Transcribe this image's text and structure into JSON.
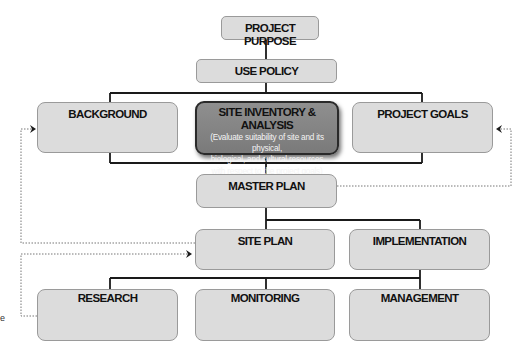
{
  "diagram": {
    "nodes": {
      "project_purpose": {
        "label": "PROJECT PURPOSE"
      },
      "use_policy": {
        "label": "USE POLICY"
      },
      "background": {
        "label": "BACKGROUND"
      },
      "site_inventory": {
        "label": "SITE INVENTORY & ANALYSIS",
        "description_lines": [
          "(Evaluate suitability of site and its physical,",
          "biological, and cultural resources",
          "with respect to the project goals)"
        ]
      },
      "project_goals": {
        "label": "PROJECT GOALS"
      },
      "master_plan": {
        "label": "MASTER PLAN"
      },
      "site_plan": {
        "label": "SITE PLAN"
      },
      "implementation": {
        "label": "IMPLEMENTATION"
      },
      "research": {
        "label": "RESEARCH"
      },
      "monitoring": {
        "label": "MONITORING"
      },
      "management": {
        "label": "MANAGEMENT"
      }
    },
    "edges": [
      {
        "from": "PROJECT PURPOSE",
        "to": "USE POLICY",
        "style": "solid"
      },
      {
        "from": "USE POLICY",
        "to": [
          "BACKGROUND",
          "SITE INVENTORY & ANALYSIS",
          "PROJECT GOALS"
        ],
        "style": "solid"
      },
      {
        "from": [
          "BACKGROUND",
          "SITE INVENTORY & ANALYSIS",
          "PROJECT GOALS"
        ],
        "to": "MASTER PLAN",
        "style": "solid"
      },
      {
        "from": "MASTER PLAN",
        "to": [
          "SITE PLAN",
          "IMPLEMENTATION"
        ],
        "style": "solid"
      },
      {
        "from": "IMPLEMENTATION",
        "to": [
          "RESEARCH",
          "MONITORING",
          "MANAGEMENT"
        ],
        "style": "solid"
      },
      {
        "from": "MASTER PLAN",
        "to": "PROJECT GOALS",
        "style": "dotted-feedback"
      },
      {
        "from": "SITE PLAN",
        "to": "BACKGROUND",
        "style": "dotted-feedback"
      },
      {
        "from": "RESEARCH",
        "to": "SITE PLAN",
        "style": "dotted-feedback"
      }
    ],
    "colors": {
      "box_fill": "#dcdcdc",
      "highlight_fill": "#858585",
      "line": "#1a1a1a",
      "dotted": "#777777"
    },
    "edge_fragment": "e"
  }
}
